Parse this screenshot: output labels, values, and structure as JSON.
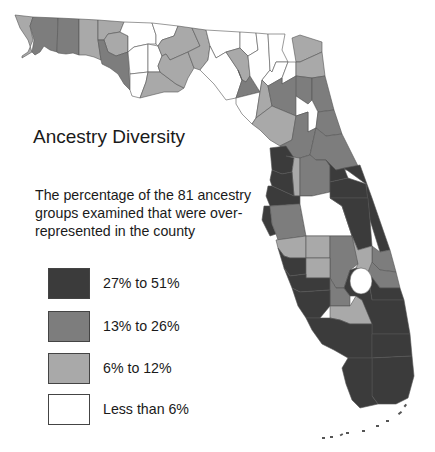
{
  "title": "Ancestry Diversity",
  "description": "The percentage of the 81 ancestry groups examined that were over-represented in the county",
  "classes": {
    "c4": {
      "label": "27% to 51%",
      "color": "#3b3b3b"
    },
    "c3": {
      "label": "13% to 26%",
      "color": "#7d7d7d"
    },
    "c2": {
      "label": "6% to 12%",
      "color": "#a9a9a9"
    },
    "c1": {
      "label": "Less than 6%",
      "color": "#ffffff"
    }
  },
  "legend": [
    {
      "class": "c4",
      "label": "27% to 51%"
    },
    {
      "class": "c3",
      "label": "13% to 26%"
    },
    {
      "class": "c2",
      "label": "6% to 12%"
    },
    {
      "class": "c1",
      "label": "Less than 6%"
    }
  ],
  "counties": [
    {
      "name": "escambia",
      "class": "c2"
    },
    {
      "name": "santa-rosa",
      "class": "c3"
    },
    {
      "name": "okaloosa",
      "class": "c3"
    },
    {
      "name": "walton",
      "class": "c2"
    },
    {
      "name": "holmes",
      "class": "c2"
    },
    {
      "name": "washington",
      "class": "c2"
    },
    {
      "name": "bay",
      "class": "c3"
    },
    {
      "name": "jackson",
      "class": "c1"
    },
    {
      "name": "calhoun",
      "class": "c1"
    },
    {
      "name": "gulf",
      "class": "c1"
    },
    {
      "name": "liberty",
      "class": "c1"
    },
    {
      "name": "franklin",
      "class": "c2"
    },
    {
      "name": "gadsden",
      "class": "c1"
    },
    {
      "name": "leon",
      "class": "c2"
    },
    {
      "name": "wakulla",
      "class": "c2"
    },
    {
      "name": "jefferson",
      "class": "c2"
    },
    {
      "name": "madison",
      "class": "c1"
    },
    {
      "name": "taylor",
      "class": "c1"
    },
    {
      "name": "hamilton",
      "class": "c1"
    },
    {
      "name": "suwannee",
      "class": "c2"
    },
    {
      "name": "lafayette",
      "class": "c3"
    },
    {
      "name": "dixie",
      "class": "c1"
    },
    {
      "name": "columbia",
      "class": "c1"
    },
    {
      "name": "baker",
      "class": "c1"
    },
    {
      "name": "union",
      "class": "c1"
    },
    {
      "name": "gilchrist",
      "class": "c2"
    },
    {
      "name": "alachua",
      "class": "c3"
    },
    {
      "name": "levy",
      "class": "c2"
    },
    {
      "name": "bradford",
      "class": "c1"
    },
    {
      "name": "nassau",
      "class": "c2"
    },
    {
      "name": "duval",
      "class": "c2"
    },
    {
      "name": "clay",
      "class": "c3"
    },
    {
      "name": "st-johns",
      "class": "c3"
    },
    {
      "name": "putnam",
      "class": "c1"
    },
    {
      "name": "flagler",
      "class": "c3"
    },
    {
      "name": "marion",
      "class": "c3"
    },
    {
      "name": "volusia",
      "class": "c3"
    },
    {
      "name": "citrus",
      "class": "c4"
    },
    {
      "name": "sumter",
      "class": "c2"
    },
    {
      "name": "lake",
      "class": "c3"
    },
    {
      "name": "hernando",
      "class": "c4"
    },
    {
      "name": "pasco",
      "class": "c4"
    },
    {
      "name": "seminole",
      "class": "c4"
    },
    {
      "name": "orange",
      "class": "c4"
    },
    {
      "name": "brevard",
      "class": "c4"
    },
    {
      "name": "pinellas",
      "class": "c4"
    },
    {
      "name": "hillsborough",
      "class": "c3"
    },
    {
      "name": "polk",
      "class": "c1"
    },
    {
      "name": "osceola",
      "class": "c4"
    },
    {
      "name": "indian-river",
      "class": "c3"
    },
    {
      "name": "manatee",
      "class": "c2"
    },
    {
      "name": "hardee",
      "class": "c2"
    },
    {
      "name": "highlands",
      "class": "c3"
    },
    {
      "name": "okeechobee",
      "class": "c2"
    },
    {
      "name": "st-lucie",
      "class": "c3"
    },
    {
      "name": "sarasota",
      "class": "c4"
    },
    {
      "name": "desoto",
      "class": "c2"
    },
    {
      "name": "martin",
      "class": "c4"
    },
    {
      "name": "charlotte",
      "class": "c4"
    },
    {
      "name": "glades",
      "class": "c3"
    },
    {
      "name": "lee",
      "class": "c4"
    },
    {
      "name": "hendry",
      "class": "c2"
    },
    {
      "name": "palm-beach",
      "class": "c4"
    },
    {
      "name": "collier",
      "class": "c4"
    },
    {
      "name": "broward",
      "class": "c4"
    },
    {
      "name": "monroe",
      "class": "c4"
    },
    {
      "name": "miami-dade",
      "class": "c4"
    }
  ]
}
